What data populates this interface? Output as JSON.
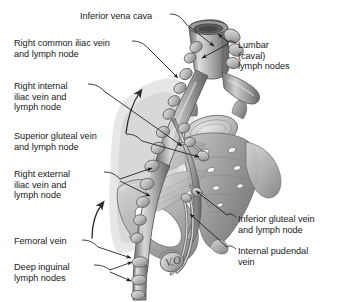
{
  "figure": {
    "signature": "V.O",
    "background_color": "#ffffff",
    "ink_color": "#1a1a1a"
  },
  "labels": [
    {
      "id": "inferior-vena-cava",
      "text": "Inferior vena cava",
      "side": "top",
      "x": 80,
      "y": 11
    },
    {
      "id": "right-common-iliac-vein-and-lymph-node",
      "text": "Right common iliac vein\nand lymph node",
      "side": "left",
      "x": 14,
      "y": 38
    },
    {
      "id": "right-internal-iliac-vein-and-lymph-node",
      "text": "Right internal\niliac vein and\nlymph node",
      "side": "left",
      "x": 14,
      "y": 81
    },
    {
      "id": "superior-gluteal-vein-and-lymph-node",
      "text": "Superior gluteal vein\nand lymph node",
      "side": "left",
      "x": 14,
      "y": 131
    },
    {
      "id": "right-external-iliac-vein-and-lymph-node",
      "text": "Right external\niliac vein and\nlymph node",
      "side": "left",
      "x": 14,
      "y": 169
    },
    {
      "id": "femoral-vein",
      "text": "Femoral vein",
      "side": "left",
      "x": 14,
      "y": 236
    },
    {
      "id": "deep-inguinal-lymph-nodes",
      "text": "Deep inguinal\nlymph nodes",
      "side": "left",
      "x": 14,
      "y": 262
    },
    {
      "id": "lumbar-caval-lymph-nodes",
      "text": "Lumbar\n(caval)\nlymph nodes",
      "side": "right",
      "x": 238,
      "y": 40
    },
    {
      "id": "inferior-gluteal-vein-and-lymph-node",
      "text": "Inferior gluteal vein\nand lymph node",
      "side": "right",
      "x": 238,
      "y": 214
    },
    {
      "id": "internal-pudendal-vein",
      "text": "Internal pudendal\nvein",
      "side": "right",
      "x": 238,
      "y": 246
    }
  ],
  "structures": [
    {
      "id": "inferior-vena-cava",
      "name": "Inferior vena cava"
    },
    {
      "id": "lumbar-caval-lymph-nodes",
      "name": "Lumbar (caval) lymph nodes"
    },
    {
      "id": "right-common-iliac-vein",
      "name": "Right common iliac vein"
    },
    {
      "id": "right-internal-iliac-vein",
      "name": "Right internal iliac vein"
    },
    {
      "id": "right-external-iliac-vein",
      "name": "Right external iliac vein"
    },
    {
      "id": "superior-gluteal-vein",
      "name": "Superior gluteal vein"
    },
    {
      "id": "inferior-gluteal-vein",
      "name": "Inferior gluteal vein"
    },
    {
      "id": "internal-pudendal-vein",
      "name": "Internal pudendal vein"
    },
    {
      "id": "femoral-vein",
      "name": "Femoral vein"
    },
    {
      "id": "deep-inguinal-lymph-nodes",
      "name": "Deep inguinal lymph nodes"
    },
    {
      "id": "sacrum",
      "name": "Sacrum"
    },
    {
      "id": "ilium",
      "name": "Ilium"
    },
    {
      "id": "lymph-flow-arrows",
      "name": "Lymph flow direction arrows"
    }
  ]
}
